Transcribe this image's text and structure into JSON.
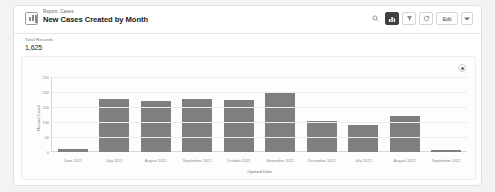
{
  "header": {
    "eyebrow": "Report: Cases",
    "title": "New Cases Created by Month",
    "report_icon": "report-icon",
    "actions": {
      "search_icon": "search-icon",
      "chart_icon": "chart-icon",
      "filter_icon": "filter-icon",
      "refresh_icon": "refresh-icon",
      "edit_label": "Edit",
      "caret_icon": "chevron-down-icon"
    }
  },
  "summary": {
    "label": "Total Records",
    "value": "1,625"
  },
  "chart_panel": {
    "legend_icon": "legend-toggle-icon"
  },
  "chart_data": {
    "type": "bar",
    "title": "New Cases Created by Month",
    "xlabel": "Opened Date",
    "ylabel": "Record Count",
    "categories": [
      "June 2021",
      "July 2021",
      "August 2021",
      "September 2021",
      "October 2021",
      "November 2021",
      "December 2021",
      "July 2022",
      "August 2022",
      "September 2022"
    ],
    "values": [
      10,
      178,
      170,
      176,
      172,
      196,
      105,
      90,
      120,
      8
    ],
    "ylim": [
      0,
      250
    ],
    "yticks": [
      250,
      200,
      150,
      100,
      50,
      0
    ],
    "bar_color": "#7f7f7f",
    "grid": true,
    "legend": false
  }
}
